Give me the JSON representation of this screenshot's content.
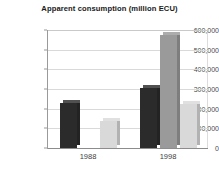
{
  "chart_data": {
    "type": "bar",
    "title": "Apparent consumption (million ECU)",
    "xlabel": "",
    "ylabel": "",
    "categories": [
      "1988",
      "1998"
    ],
    "ylim": [
      0,
      600000
    ],
    "ytick_labels": [
      "600,000",
      "500,000",
      "400,000",
      "300,000",
      "200,000",
      "100,000",
      "0"
    ],
    "ytick_values": [
      600000,
      500000,
      400000,
      300000,
      200000,
      100000,
      0
    ],
    "grid": true,
    "legend": "none",
    "series": [
      {
        "name": "series-1",
        "color": "#2b2b2b",
        "values": [
          229000,
          305000
        ]
      },
      {
        "name": "series-2",
        "color": "#9a9a9a",
        "values": [
          null,
          574000
        ]
      },
      {
        "name": "series-3",
        "color": "#d9d9d9",
        "values": [
          137000,
          224000
        ]
      }
    ]
  },
  "colors": {
    "dark_bar": "#2b2b2b",
    "mid_bar": "#9a9a9a",
    "light_bar": "#d9d9d9",
    "gridline": "#d9d9d9",
    "axis": "#9a9a9a",
    "background": "#ffffff",
    "title_text": "#1a1a1a",
    "tick_text": "#4a4a4a"
  }
}
